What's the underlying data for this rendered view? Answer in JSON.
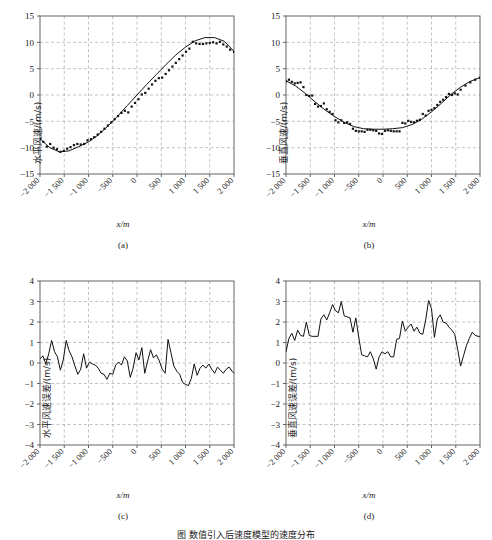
{
  "figure": {
    "caption": "图 数值引入后速度模型的速度分布"
  },
  "chart_data": [
    {
      "id": "a",
      "type": "scatter",
      "panel_label": "(a)",
      "title": "",
      "xlabel": "x/m",
      "ylabel": "水平风速/(m/s)",
      "xlim": [
        -2000,
        2000
      ],
      "ylim": [
        -15,
        15
      ],
      "xticks": [
        -2000,
        -1500,
        -1000,
        -500,
        0,
        500,
        1000,
        1500,
        2000
      ],
      "xticklabels": [
        "−2 000",
        "−1 500",
        "−1 000",
        "−500",
        "0",
        "500",
        "1 000",
        "1 500",
        "2 000"
      ],
      "yticks": [
        15,
        10,
        5,
        0,
        -5,
        -10,
        -15
      ],
      "yticklabels": [
        "15",
        "10",
        "5",
        "0",
        "−5",
        "−10",
        "−15"
      ],
      "grid": true,
      "legend": "none",
      "series": [
        {
          "name": "观测点",
          "marker": "square",
          "x": [
            -2000,
            -1930,
            -1860,
            -1790,
            -1720,
            -1650,
            -1580,
            -1510,
            -1440,
            -1370,
            -1300,
            -1230,
            -1160,
            -1090,
            -1020,
            -950,
            -880,
            -810,
            -740,
            -670,
            -600,
            -530,
            -460,
            -390,
            -320,
            -250,
            -180,
            -110,
            -40,
            30,
            100,
            170,
            240,
            310,
            380,
            450,
            520,
            590,
            660,
            730,
            800,
            870,
            940,
            1010,
            1080,
            1150,
            1220,
            1290,
            1360,
            1430,
            1500,
            1570,
            1640,
            1710,
            1780,
            1850,
            1920,
            2000
          ],
          "y": [
            -8.4,
            -8.9,
            -9.8,
            -9.3,
            -10.0,
            -10.3,
            -10.8,
            -10.6,
            -10.2,
            -9.9,
            -9.5,
            -9.3,
            -9.4,
            -9.3,
            -8.6,
            -8.4,
            -8.0,
            -7.5,
            -7.0,
            -6.4,
            -5.8,
            -5.2,
            -4.6,
            -4.0,
            -3.4,
            -3.0,
            -3.3,
            -2.2,
            -1.5,
            -0.8,
            0.1,
            0.4,
            1.2,
            2.0,
            2.7,
            3.2,
            3.3,
            4.0,
            4.7,
            5.4,
            6.1,
            6.8,
            7.5,
            8.2,
            8.8,
            10.1,
            9.8,
            9.7,
            9.7,
            9.8,
            9.9,
            10.0,
            9.8,
            10.1,
            9.6,
            9.2,
            8.6,
            8.2
          ]
        },
        {
          "name": "拟合曲线",
          "type": "line",
          "x": [
            -2000,
            -1800,
            -1600,
            -1400,
            -1200,
            -1000,
            -800,
            -600,
            -400,
            -200,
            0,
            200,
            400,
            600,
            800,
            1000,
            1200,
            1400,
            1600,
            1800,
            2000
          ],
          "y": [
            -8.3,
            -10.0,
            -10.8,
            -10.6,
            -9.8,
            -8.9,
            -7.6,
            -5.9,
            -4.0,
            -2.0,
            0.0,
            2.0,
            3.9,
            5.8,
            7.6,
            9.1,
            10.3,
            10.9,
            10.9,
            10.2,
            8.3
          ]
        }
      ]
    },
    {
      "id": "b",
      "type": "scatter",
      "panel_label": "(b)",
      "title": "",
      "xlabel": "x/m",
      "ylabel": "垂直风速/(m/s)",
      "xlim": [
        -2000,
        2000
      ],
      "ylim": [
        -15,
        15
      ],
      "xticks": [
        -2000,
        -1500,
        -1000,
        -500,
        0,
        500,
        1000,
        1500,
        2000
      ],
      "xticklabels": [
        "−2 000",
        "−1 500",
        "−1 000",
        "−500",
        "0",
        "500",
        "1 000",
        "1 500",
        "2 000"
      ],
      "yticks": [
        15,
        10,
        5,
        0,
        -5,
        -10,
        -15
      ],
      "yticklabels": [
        "15",
        "10",
        "5",
        "0",
        "−5",
        "−10",
        "−15"
      ],
      "grid": true,
      "legend": "none",
      "series": [
        {
          "name": "观测点",
          "marker": "square",
          "x": [
            -2000,
            -1940,
            -1880,
            -1820,
            -1760,
            -1700,
            -1640,
            -1580,
            -1520,
            -1460,
            -1400,
            -1340,
            -1280,
            -1220,
            -1160,
            -1100,
            -1040,
            -980,
            -920,
            -860,
            -800,
            -740,
            -680,
            -620,
            -560,
            -500,
            -440,
            -380,
            -320,
            -260,
            -200,
            -140,
            -80,
            -20,
            40,
            100,
            160,
            220,
            280,
            340,
            400,
            460,
            520,
            580,
            640,
            700,
            760,
            820,
            880,
            940,
            1000,
            1060,
            1120,
            1180,
            1240,
            1300,
            1360,
            1420,
            1480,
            1540,
            1600,
            1700,
            1800,
            1900,
            2000
          ],
          "y": [
            2.6,
            2.9,
            2.5,
            2.2,
            2.3,
            2.4,
            1.5,
            0.0,
            -0.2,
            -0.1,
            -1.7,
            -2.2,
            -2.1,
            -1.6,
            -2.7,
            -3.2,
            -3.6,
            -4.8,
            -5.2,
            -4.8,
            -5.3,
            -5.2,
            -5.5,
            -6.4,
            -6.8,
            -6.9,
            -6.9,
            -7.0,
            -6.6,
            -6.6,
            -6.7,
            -6.8,
            -7.3,
            -7.4,
            -6.8,
            -6.7,
            -6.8,
            -6.9,
            -6.9,
            -6.9,
            -5.3,
            -5.4,
            -4.9,
            -5.1,
            -5.2,
            -4.9,
            -4.7,
            -3.6,
            -3.9,
            -3.0,
            -2.8,
            -2.5,
            -1.9,
            -1.3,
            -0.9,
            -0.4,
            0.2,
            0.0,
            0.3,
            0.1,
            1.0,
            1.8,
            2.4,
            2.9,
            3.3
          ]
        },
        {
          "name": "拟合曲线",
          "type": "line",
          "x": [
            -2000,
            -1800,
            -1600,
            -1400,
            -1200,
            -1000,
            -800,
            -600,
            -400,
            -200,
            0,
            200,
            400,
            600,
            800,
            1000,
            1200,
            1400,
            1600,
            1800,
            2000
          ],
          "y": [
            2.7,
            1.7,
            0.3,
            -1.3,
            -2.8,
            -4.1,
            -5.2,
            -6.0,
            -6.4,
            -6.5,
            -6.5,
            -6.4,
            -6.2,
            -5.6,
            -4.6,
            -3.2,
            -1.6,
            0.1,
            1.5,
            2.6,
            3.3
          ]
        }
      ]
    },
    {
      "id": "c",
      "type": "line",
      "panel_label": "(c)",
      "title": "",
      "xlabel": "x/m",
      "ylabel": "水平风速误差/(m/s)",
      "xlim": [
        -2000,
        2000
      ],
      "ylim": [
        -4,
        4
      ],
      "xticks": [
        -2000,
        -1500,
        -1000,
        -500,
        0,
        500,
        1000,
        1500,
        2000
      ],
      "xticklabels": [
        "−2 000",
        "−1 500",
        "−1 000",
        "−500",
        "0",
        "500",
        "1 000",
        "1 500",
        "2 000"
      ],
      "yticks": [
        4,
        3,
        2,
        1,
        0,
        -1,
        -2,
        -3,
        -4
      ],
      "yticklabels": [
        "4",
        "3",
        "2",
        "1",
        "0",
        "−1",
        "−2",
        "−3",
        "−4"
      ],
      "grid": true,
      "legend": "none",
      "series": [
        {
          "name": "水平风速误差",
          "x": [
            -2000,
            -1940,
            -1880,
            -1820,
            -1760,
            -1700,
            -1640,
            -1580,
            -1520,
            -1460,
            -1400,
            -1340,
            -1280,
            -1220,
            -1160,
            -1100,
            -1040,
            -980,
            -920,
            -860,
            -800,
            -740,
            -680,
            -620,
            -560,
            -500,
            -440,
            -380,
            -320,
            -260,
            -200,
            -140,
            -80,
            -20,
            40,
            100,
            160,
            220,
            280,
            340,
            400,
            460,
            520,
            580,
            640,
            700,
            760,
            820,
            880,
            940,
            1000,
            1060,
            1120,
            1180,
            1240,
            1300,
            1360,
            1420,
            1480,
            1540,
            1600,
            1660,
            1720,
            1780,
            1840,
            1900,
            1960,
            2000
          ],
          "y": [
            0.2,
            0.35,
            -0.05,
            0.45,
            1.1,
            0.55,
            0.3,
            -0.35,
            0.15,
            1.1,
            0.6,
            0.3,
            -0.15,
            -0.55,
            -0.3,
            0.45,
            -0.25,
            0.05,
            -0.05,
            -0.1,
            -0.25,
            -0.5,
            -0.55,
            -0.8,
            -0.5,
            -0.55,
            -0.1,
            0.05,
            -0.1,
            0.3,
            0.1,
            -0.7,
            -0.25,
            0.5,
            0.15,
            0.75,
            -0.5,
            0.1,
            0.65,
            0.25,
            0.4,
            0.1,
            -0.3,
            -0.5,
            1.15,
            0.5,
            -0.15,
            -0.4,
            -0.55,
            -0.95,
            -1.05,
            -1.1,
            -0.75,
            -0.05,
            -0.6,
            -0.25,
            -0.1,
            -0.25,
            -0.05,
            -0.3,
            -0.5,
            -0.2,
            -0.35,
            -0.5,
            -0.3,
            -0.2,
            -0.4,
            -0.5
          ]
        }
      ]
    },
    {
      "id": "d",
      "type": "line",
      "panel_label": "(d)",
      "title": "",
      "xlabel": "x/m",
      "ylabel": "垂直风速误差/(m/s)",
      "xlim": [
        -2000,
        2000
      ],
      "ylim": [
        -4,
        4
      ],
      "xticks": [
        -2000,
        -1500,
        -1000,
        -500,
        0,
        500,
        1000,
        1500,
        2000
      ],
      "xticklabels": [
        "−2 000",
        "−1 500",
        "−1 000",
        "−500",
        "0",
        "500",
        "1 000",
        "1 500",
        "2 000"
      ],
      "yticks": [
        4,
        3,
        2,
        1,
        0,
        -1,
        -2,
        -3,
        -4
      ],
      "yticklabels": [
        "4",
        "3",
        "2",
        "1",
        "0",
        "−1",
        "−2",
        "−3",
        "−4"
      ],
      "grid": true,
      "legend": "none",
      "series": [
        {
          "name": "垂直风速误差",
          "x": [
            -2000,
            -1940,
            -1880,
            -1820,
            -1760,
            -1700,
            -1640,
            -1580,
            -1520,
            -1460,
            -1400,
            -1340,
            -1280,
            -1220,
            -1160,
            -1100,
            -1040,
            -980,
            -920,
            -860,
            -800,
            -740,
            -680,
            -620,
            -560,
            -500,
            -440,
            -380,
            -320,
            -260,
            -200,
            -140,
            -80,
            -20,
            40,
            100,
            160,
            220,
            280,
            340,
            400,
            460,
            520,
            580,
            640,
            700,
            760,
            820,
            880,
            940,
            1000,
            1060,
            1120,
            1180,
            1240,
            1300,
            1360,
            1420,
            1480,
            1540,
            1600,
            1660,
            1720,
            1780,
            1840,
            1900,
            1960,
            2000
          ],
          "y": [
            0.55,
            1.2,
            1.45,
            1.1,
            1.6,
            1.35,
            1.3,
            2.0,
            1.35,
            1.3,
            1.3,
            1.3,
            2.15,
            2.35,
            2.1,
            2.45,
            2.85,
            2.55,
            2.45,
            3.0,
            2.3,
            2.25,
            2.2,
            1.5,
            2.2,
            1.25,
            0.4,
            0.35,
            0.3,
            0.55,
            0.2,
            -0.3,
            0.3,
            0.55,
            0.45,
            0.55,
            0.3,
            0.3,
            1.15,
            1.2,
            2.05,
            1.55,
            1.75,
            1.9,
            1.55,
            1.75,
            1.45,
            1.4,
            2.1,
            3.05,
            2.65,
            1.25,
            2.15,
            2.35,
            2.0,
            1.95,
            1.75,
            1.6,
            1.4,
            0.65,
            -0.15,
            0.35,
            0.85,
            1.2,
            1.5,
            1.35,
            1.3,
            1.3
          ]
        }
      ]
    }
  ]
}
